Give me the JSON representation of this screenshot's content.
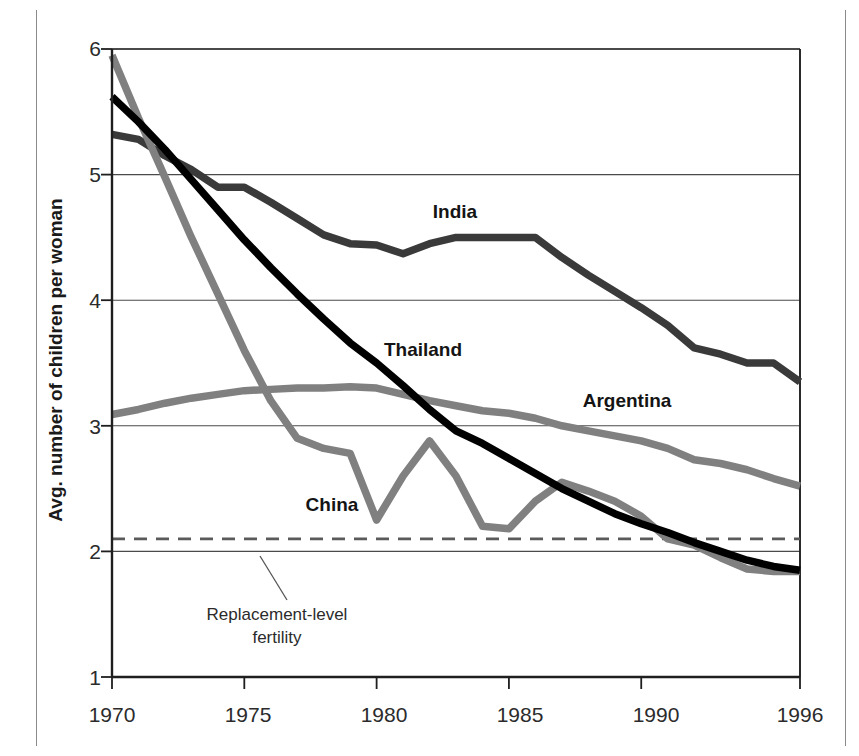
{
  "figure": {
    "background_color": "#ffffff",
    "frame_color": "#8a8a8a"
  },
  "axis": {
    "y_title": "Avg. number of children per woman",
    "y_ticks": [
      "6",
      "5",
      "4",
      "3",
      "2",
      "1"
    ],
    "x_ticks": [
      "1970",
      "1975",
      "1980",
      "1985",
      "1990",
      "1996"
    ]
  },
  "series_labels": {
    "india": "India",
    "thailand": "Thailand",
    "argentina": "Argentina",
    "china": "China"
  },
  "annotation": {
    "replacement_line_1": "Replacement-level",
    "replacement_line_2": "fertility"
  },
  "colors": {
    "india": "#3a3a3a",
    "thailand": "#000000",
    "argentina": "#808080",
    "china": "#808080",
    "gridline": "#4a4a4a",
    "axis": "#1f1f1f",
    "replacement_dash": "#5a5a5a"
  },
  "chart_data": {
    "type": "line",
    "title": "",
    "subtitle": "",
    "xlabel": "",
    "ylabel": "Avg. number of children per woman",
    "xlim": [
      1970,
      1996
    ],
    "ylim": [
      1,
      6
    ],
    "grid": true,
    "legend_position": "inline-labels",
    "x": [
      1970,
      1971,
      1972,
      1973,
      1974,
      1975,
      1976,
      1977,
      1978,
      1979,
      1980,
      1981,
      1982,
      1983,
      1984,
      1985,
      1986,
      1987,
      1988,
      1989,
      1990,
      1991,
      1992,
      1993,
      1994,
      1995,
      1996
    ],
    "series": [
      {
        "name": "India",
        "color": "#3a3a3a",
        "values": [
          5.32,
          5.28,
          5.15,
          5.04,
          4.9,
          4.9,
          4.78,
          4.65,
          4.52,
          4.45,
          4.44,
          4.37,
          4.45,
          4.5,
          4.5,
          4.5,
          4.5,
          4.34,
          4.2,
          4.07,
          3.94,
          3.8,
          3.62,
          3.57,
          3.5,
          3.5,
          3.35
        ]
      },
      {
        "name": "Thailand",
        "color": "#000000",
        "values": [
          5.62,
          5.42,
          5.2,
          4.96,
          4.72,
          4.48,
          4.26,
          4.05,
          3.85,
          3.66,
          3.5,
          3.32,
          3.13,
          2.96,
          2.86,
          2.74,
          2.62,
          2.5,
          2.4,
          2.3,
          2.22,
          2.15,
          2.07,
          2.0,
          1.93,
          1.88,
          1.85
        ]
      },
      {
        "name": "China",
        "color": "#808080",
        "values": [
          5.95,
          5.45,
          4.98,
          4.5,
          4.05,
          3.6,
          3.2,
          2.9,
          2.82,
          2.78,
          2.25,
          2.6,
          2.88,
          2.6,
          2.2,
          2.18,
          2.4,
          2.55,
          2.48,
          2.4,
          2.28,
          2.1,
          2.05,
          1.95,
          1.86,
          1.84,
          1.84
        ]
      },
      {
        "name": "Argentina",
        "color": "#808080",
        "values": [
          3.09,
          3.13,
          3.18,
          3.22,
          3.25,
          3.28,
          3.29,
          3.3,
          3.3,
          3.31,
          3.3,
          3.25,
          3.2,
          3.16,
          3.12,
          3.1,
          3.06,
          3.0,
          2.96,
          2.92,
          2.88,
          2.82,
          2.73,
          2.7,
          2.65,
          2.58,
          2.52
        ]
      }
    ],
    "reference_lines": [
      {
        "name": "Replacement-level fertility",
        "value": 2.1,
        "style": "dashed",
        "color": "#5a5a5a",
        "label": "Replacement-level fertility"
      }
    ],
    "annotations": [
      {
        "text": "India",
        "x": 1982.6,
        "y": 4.72
      },
      {
        "text": "Thailand",
        "x": 1981.4,
        "y": 3.61
      },
      {
        "text": "Argentina",
        "x": 1988.8,
        "y": 3.18
      },
      {
        "text": "China",
        "x": 1978.2,
        "y": 2.42
      }
    ]
  }
}
